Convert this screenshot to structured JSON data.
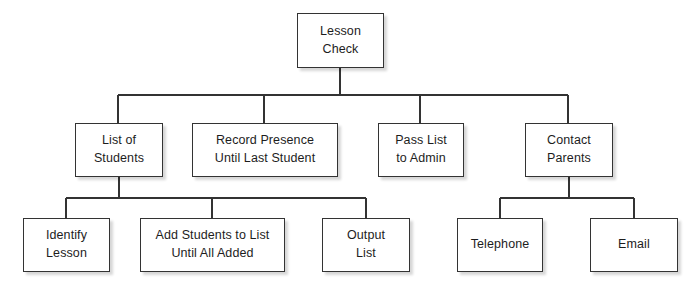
{
  "diagram": {
    "type": "hierarchy-tree",
    "style": {
      "background": "#ffffff",
      "node_fill": "#ffffff",
      "node_border": "#333333",
      "text_color": "#1d1d1d",
      "edge_color": "#333333"
    },
    "nodes": [
      {
        "id": "lesson-check",
        "label": "Lesson\nCheck",
        "level": 0,
        "x": 297,
        "y": 13,
        "w": 87,
        "h": 55
      },
      {
        "id": "list-of-students",
        "label": "List of\nStudents",
        "level": 1,
        "x": 75,
        "y": 123,
        "w": 88,
        "h": 54
      },
      {
        "id": "record-presence",
        "label": "Record Presence\nUntil Last Student",
        "level": 1,
        "x": 192,
        "y": 123,
        "w": 146,
        "h": 54
      },
      {
        "id": "pass-list",
        "label": "Pass List\nto Admin",
        "level": 1,
        "x": 378,
        "y": 123,
        "w": 86,
        "h": 54
      },
      {
        "id": "contact-parents",
        "label": "Contact\nParents",
        "level": 1,
        "x": 525,
        "y": 123,
        "w": 88,
        "h": 54
      },
      {
        "id": "identify-lesson",
        "label": "Identify\nLesson",
        "level": 2,
        "x": 23,
        "y": 218,
        "w": 87,
        "h": 54
      },
      {
        "id": "add-students",
        "label": "Add Students to List\nUntil All Added",
        "level": 2,
        "x": 140,
        "y": 218,
        "w": 145,
        "h": 54
      },
      {
        "id": "output-list",
        "label": "Output\nList",
        "level": 2,
        "x": 322,
        "y": 218,
        "w": 88,
        "h": 54
      },
      {
        "id": "telephone",
        "label": "Telephone",
        "level": 2,
        "x": 457,
        "y": 218,
        "w": 86,
        "h": 54
      },
      {
        "id": "email",
        "label": "Email",
        "level": 2,
        "x": 590,
        "y": 218,
        "w": 88,
        "h": 54
      }
    ],
    "edges": [
      {
        "from": "lesson-check",
        "to": "list-of-students"
      },
      {
        "from": "lesson-check",
        "to": "record-presence"
      },
      {
        "from": "lesson-check",
        "to": "pass-list"
      },
      {
        "from": "lesson-check",
        "to": "contact-parents"
      },
      {
        "from": "list-of-students",
        "to": "identify-lesson"
      },
      {
        "from": "list-of-students",
        "to": "add-students"
      },
      {
        "from": "list-of-students",
        "to": "output-list"
      },
      {
        "from": "contact-parents",
        "to": "telephone"
      },
      {
        "from": "contact-parents",
        "to": "email"
      }
    ],
    "buses": [
      {
        "id": "bus-root",
        "y": 95,
        "x1": 118,
        "x2": 568,
        "parent_x": 340,
        "parent_bottom": 68,
        "drops": [
          118,
          264,
          420,
          568
        ],
        "child_top": 123
      },
      {
        "id": "bus-list-students",
        "y": 198,
        "x1": 66,
        "x2": 366,
        "parent_x": 119,
        "parent_bottom": 177,
        "drops": [
          66,
          212,
          366
        ],
        "child_top": 218
      },
      {
        "id": "bus-contact-parents",
        "y": 198,
        "x1": 500,
        "x2": 634,
        "parent_x": 569,
        "parent_bottom": 177,
        "drops": [
          500,
          634
        ],
        "child_top": 218
      }
    ]
  }
}
